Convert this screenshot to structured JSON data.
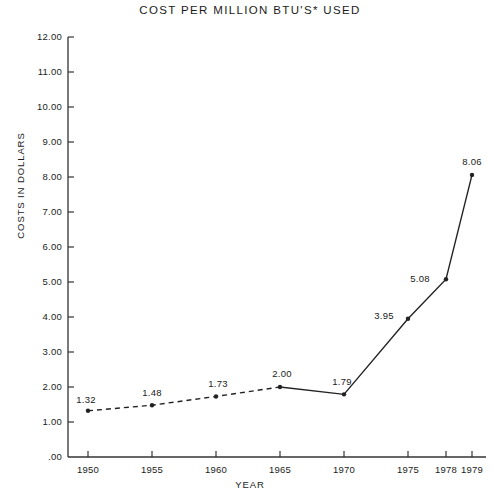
{
  "chart_data": {
    "type": "line",
    "title": "COST PER MILLION BTU'S* USED",
    "xlabel": "YEAR",
    "ylabel": "COSTS IN DOLLARS",
    "x": [
      1950,
      1955,
      1960,
      1965,
      1970,
      1975,
      1978,
      1979
    ],
    "categories": [
      "1950",
      "1955",
      "1960",
      "1965",
      "1970",
      "1975",
      "1978",
      "1979"
    ],
    "values": [
      1.32,
      1.48,
      1.73,
      2.0,
      1.79,
      3.95,
      5.08,
      8.06
    ],
    "point_labels": [
      "1.32",
      "1.48",
      "1.73",
      "2.00",
      "1.79",
      "3.95",
      "5.08",
      "8.06"
    ],
    "series": [
      {
        "name": "Cost per million BTU's used",
        "values": [
          1.32,
          1.48,
          1.73,
          2.0,
          1.79,
          3.95,
          5.08,
          8.06
        ]
      }
    ],
    "ylim": [
      0,
      12
    ],
    "ytick_values": [
      12,
      11,
      10,
      9,
      8,
      7,
      6,
      5,
      4,
      3,
      2,
      1,
      0
    ],
    "ytick_labels": [
      "12.00",
      "11.00",
      "10.00",
      "9.00",
      "8.00",
      "7.00",
      "6.00",
      "5.00",
      "4.00",
      "3.00",
      "2.00",
      "1.00",
      ".00"
    ],
    "xtick_labels": [
      "1950",
      "1955",
      "1960",
      "1965",
      "1970",
      "1975",
      "1978",
      "1979"
    ],
    "grid": false,
    "legend": "none",
    "line_style_note": "dashed from 1950 to 1965, solid from 1965 to 1979",
    "marker": "filled-dot",
    "colors": {
      "line": "#222222",
      "axis": "#333333",
      "text": "#1b1b1b",
      "background": "#ffffff"
    }
  }
}
